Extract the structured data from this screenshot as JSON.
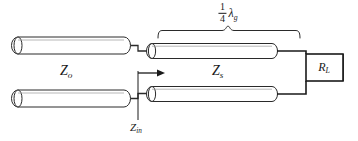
{
  "figure": {
    "type": "transmission-line-schematic",
    "background_color": "#ffffff",
    "line_color": "#1a1a1a",
    "fill_color": "#ffffff"
  },
  "labels": {
    "source_line_impedance": {
      "symbol": "Z",
      "subscript": "o"
    },
    "transformer_impedance": {
      "symbol": "Z",
      "subscript": "s"
    },
    "input_impedance": {
      "symbol": "Z",
      "subscript": "in"
    },
    "load_resistance": {
      "symbol": "R",
      "subscript": "L"
    },
    "length": {
      "numerator": "1",
      "denominator": "4",
      "wavelength_symbol": "λ",
      "wavelength_subscript": "g"
    }
  },
  "elements": {
    "left_line_upper": "transmission-line-cylinder",
    "left_line_lower": "transmission-line-cylinder",
    "transformer_line_upper": "transmission-line-cylinder",
    "transformer_line_lower": "transmission-line-cylinder",
    "load_box": "resistor-box",
    "reference_plane": "z-in-reference-plane",
    "direction_arrow": "right-arrow",
    "span_brace": "curly-brace-span"
  }
}
